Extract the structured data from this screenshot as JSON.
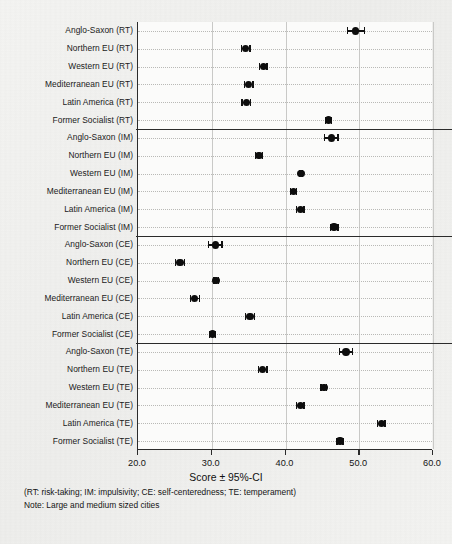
{
  "figure": {
    "background_color": "#f2f2f0",
    "plot_background_color": "#fbfbfa",
    "axis_color": "#2b2b2b",
    "marker_color": "#0d0d0d",
    "grid_color": "#b9b9b6"
  },
  "footnotes": {
    "abbreviations": "(RT: risk-taking; IM: impulsivity; CE: self-centeredness; TE: temperament)",
    "note": "Note: Large and medium sized cities"
  },
  "chart_data": {
    "type": "scatter",
    "title": "",
    "subtitle": "",
    "xlabel": "Score ± 95%-CI",
    "ylabel": "",
    "xlim": [
      20.0,
      60.0
    ],
    "ylim": [
      0,
      24
    ],
    "xticks": [
      20.0,
      30.0,
      40.0,
      50.0,
      60.0
    ],
    "xticklabels": [
      "20.0",
      "30.0",
      "40.0",
      "50.0",
      "60.0"
    ],
    "grid": "dotted-horizontal-and-solid-vertical",
    "legend": "none",
    "orientation": "horizontal-forest-plot",
    "error_bar_type": "95% confidence interval",
    "group_separators_after": [
      "Former Socialist (RT)",
      "Former Socialist (IM)",
      "Former Socialist (CE)"
    ],
    "groups": [
      {
        "code": "RT",
        "name": "risk-taking"
      },
      {
        "code": "IM",
        "name": "impulsivity"
      },
      {
        "code": "CE",
        "name": "self-centeredness"
      },
      {
        "code": "TE",
        "name": "temperament"
      }
    ],
    "categories": [
      "Anglo-Saxon (RT)",
      "Northern EU (RT)",
      "Western EU (RT)",
      "Mediterranean EU (RT)",
      "Latin America (RT)",
      "Former Socialist (RT)",
      "Anglo-Saxon (IM)",
      "Northern EU (IM)",
      "Western EU (IM)",
      "Mediterranean EU (IM)",
      "Latin America (IM)",
      "Former Socialist (IM)",
      "Anglo-Saxon (CE)",
      "Northern EU (CE)",
      "Western EU (CE)",
      "Mediterranean EU (CE)",
      "Latin America (CE)",
      "Former Socialist (CE)",
      "Anglo-Saxon (TE)",
      "Northern EU (TE)",
      "Western EU (TE)",
      "Mediterranean EU (TE)",
      "Latin America (TE)",
      "Former Socialist (TE)"
    ],
    "values": [
      49.5,
      34.6,
      37.0,
      35.0,
      34.7,
      45.8,
      46.2,
      36.4,
      42.1,
      41.1,
      42.0,
      46.6,
      30.5,
      25.7,
      30.6,
      27.7,
      35.2,
      30.1,
      48.2,
      36.9,
      45.2,
      42.0,
      53.0,
      47.4
    ],
    "ci_low": [
      48.4,
      34.0,
      36.5,
      34.4,
      34.1,
      45.4,
      45.3,
      35.9,
      41.9,
      40.7,
      41.5,
      46.1,
      29.6,
      25.1,
      30.3,
      27.1,
      34.6,
      29.7,
      47.3,
      36.3,
      44.8,
      41.5,
      52.5,
      47.0
    ],
    "ci_high": [
      50.7,
      35.2,
      37.5,
      35.6,
      35.3,
      46.2,
      47.1,
      36.9,
      42.3,
      41.5,
      42.5,
      47.1,
      31.4,
      26.3,
      30.9,
      28.3,
      35.8,
      30.5,
      49.1,
      37.5,
      45.6,
      42.5,
      53.5,
      47.8
    ]
  }
}
